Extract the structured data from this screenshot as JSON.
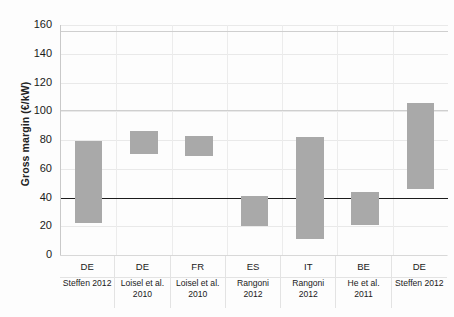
{
  "chart_data": {
    "type": "bar",
    "title": "",
    "subtitle": "",
    "xlabel": "",
    "ylabel": "Gross margin (€/kW)",
    "ylim": [
      0,
      160
    ],
    "yticks": [
      0,
      20,
      40,
      60,
      80,
      100,
      120,
      140,
      160
    ],
    "grid": true,
    "legend": "none",
    "bar_style": "floating-range",
    "bar_color": "#a9a9a9",
    "categories": [
      "DE",
      "DE",
      "FR",
      "ES",
      "IT",
      "BE",
      "DE"
    ],
    "sources": [
      "Steffen 2012",
      "Loisel et al. 2010",
      "Loisel et al. 2010",
      "Rangoni 2012",
      "Rangoni 2012",
      "He et al. 2011",
      "Steffen 2012"
    ],
    "low": [
      22,
      70,
      69,
      20,
      11,
      21,
      46
    ],
    "high": [
      79,
      86,
      83,
      41,
      82,
      44,
      106
    ],
    "series": [
      {
        "name": "Gross margin range",
        "values": [
          {
            "category": "DE",
            "source": "Steffen 2012",
            "low": 22,
            "high": 79
          },
          {
            "category": "DE",
            "source": "Loisel et al. 2010",
            "low": 70,
            "high": 86
          },
          {
            "category": "FR",
            "source": "Loisel et al. 2010",
            "low": 69,
            "high": 83
          },
          {
            "category": "ES",
            "source": "Rangoni 2012",
            "low": 20,
            "high": 41
          },
          {
            "category": "IT",
            "source": "Rangoni 2012",
            "low": 11,
            "high": 82
          },
          {
            "category": "BE",
            "source": "He et al. 2011",
            "low": 21,
            "high": 44
          },
          {
            "category": "DE",
            "source": "Steffen 2012",
            "low": 46,
            "high": 106
          }
        ]
      }
    ],
    "reference_lines": [
      {
        "value": 156,
        "color": "#cfcfcf",
        "style": "solid"
      },
      {
        "value": 101,
        "color": "#cfcfcf",
        "style": "solid"
      },
      {
        "value": 40,
        "color": "#1c1c1c",
        "style": "solid"
      }
    ],
    "annotations": []
  },
  "axis": {
    "y_title": "Gross margin (€/kW)",
    "tick_labels": [
      "160",
      "140",
      "120",
      "100",
      "80",
      "60",
      "40",
      "20",
      "0"
    ]
  },
  "xaxis_rows": [
    {
      "country": "DE",
      "source": "Steffen 2012"
    },
    {
      "country": "DE",
      "source": "Loisel et al. 2010"
    },
    {
      "country": "FR",
      "source": "Loisel et al. 2010"
    },
    {
      "country": "ES",
      "source": "Rangoni 2012"
    },
    {
      "country": "IT",
      "source": "Rangoni 2012"
    },
    {
      "country": "BE",
      "source": "He et al. 2011"
    },
    {
      "country": "DE",
      "source": "Steffen 2012"
    }
  ]
}
